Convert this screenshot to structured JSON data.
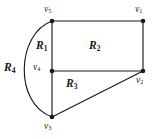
{
  "figure": {
    "stroke_color": "#1a1a1a",
    "background_color": "#ffffff",
    "vertices": [
      {
        "id": "v1",
        "base": "v",
        "sub": "1",
        "x": 143,
        "y": 21,
        "label_x": 135,
        "label_y": 5
      },
      {
        "id": "v2",
        "base": "v",
        "sub": "2",
        "x": 143,
        "y": 71,
        "label_x": 136,
        "label_y": 76
      },
      {
        "id": "v3",
        "base": "v",
        "sub": "3",
        "x": 52,
        "y": 117,
        "label_x": 44,
        "label_y": 122
      },
      {
        "id": "v4",
        "base": "v",
        "sub": "4",
        "x": 52,
        "y": 71,
        "label_x": 33,
        "label_y": 63
      },
      {
        "id": "v5",
        "base": "v",
        "sub": "5",
        "x": 52,
        "y": 21,
        "label_x": 44,
        "label_y": 5
      }
    ],
    "edges": [
      {
        "id": "e-v5-v1",
        "from": "v5",
        "to": "v1",
        "type": "line"
      },
      {
        "id": "e-v1-v2",
        "from": "v1",
        "to": "v2",
        "type": "line"
      },
      {
        "id": "e-v5-v4",
        "from": "v5",
        "to": "v4",
        "type": "line"
      },
      {
        "id": "e-v4-v2",
        "from": "v4",
        "to": "v2",
        "type": "line"
      },
      {
        "id": "e-v4-v3",
        "from": "v4",
        "to": "v3",
        "type": "line"
      },
      {
        "id": "e-v3-v2",
        "from": "v3",
        "to": "v2",
        "type": "line"
      },
      {
        "id": "e-v5-v3-arc",
        "from": "v5",
        "to": "v3",
        "type": "arc"
      }
    ],
    "regions": [
      {
        "id": "R1",
        "base": "R",
        "sub": "1",
        "label_x": 36,
        "label_y": 40
      },
      {
        "id": "R2",
        "base": "R",
        "sub": "2",
        "label_x": 89,
        "label_y": 40
      },
      {
        "id": "R3",
        "base": "R",
        "sub": "3",
        "label_x": 66,
        "label_y": 78
      },
      {
        "id": "R4",
        "base": "R",
        "sub": "4",
        "label_x": 4,
        "label_y": 62
      }
    ]
  }
}
